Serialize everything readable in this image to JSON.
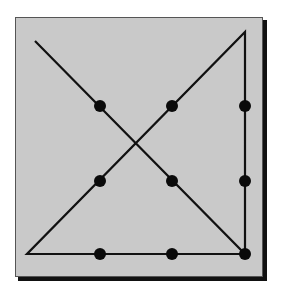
{
  "diagram": {
    "title": "Nine dots puzzle solution",
    "colors": {
      "page_background": "#ffffff",
      "panel_fill": "#c9c9c9",
      "panel_border": "#555555",
      "shadow": "#111111",
      "line": "#111111",
      "dot": "#0a0a0a"
    },
    "panel": {
      "x": 15,
      "y": 17,
      "width": 248,
      "height": 260,
      "shadow_offset": 4
    },
    "dots": [
      {
        "id": "r1c1",
        "x": 100,
        "y": 106
      },
      {
        "id": "r1c2",
        "x": 172,
        "y": 106
      },
      {
        "id": "r1c3",
        "x": 245,
        "y": 106
      },
      {
        "id": "r2c1",
        "x": 100,
        "y": 181
      },
      {
        "id": "r2c2",
        "x": 172,
        "y": 181
      },
      {
        "id": "r2c3",
        "x": 245,
        "y": 181
      },
      {
        "id": "r3c1",
        "x": 100,
        "y": 254
      },
      {
        "id": "r3c2",
        "x": 172,
        "y": 254
      },
      {
        "id": "r3c3",
        "x": 245,
        "y": 254
      }
    ],
    "dot_radius": 6,
    "path": {
      "description": "Four connected straight lines passing through all nine dots",
      "points": [
        {
          "x": 35,
          "y": 41
        },
        {
          "x": 245,
          "y": 254
        },
        {
          "x": 245,
          "y": 32
        },
        {
          "x": 27,
          "y": 254
        },
        {
          "x": 245,
          "y": 254
        }
      ],
      "stroke_width": 2.2
    }
  }
}
